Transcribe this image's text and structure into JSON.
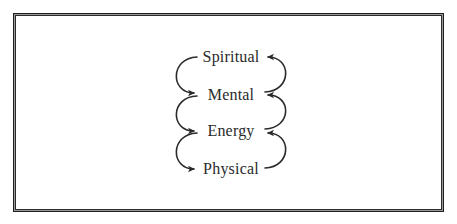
{
  "diagram": {
    "type": "cycle-stack",
    "levels": [
      {
        "label": "Spiritual"
      },
      {
        "label": "Mental"
      },
      {
        "label": "Energy"
      },
      {
        "label": "Physical"
      }
    ],
    "connections": [
      {
        "from": "Spiritual",
        "to": "Mental",
        "side": "left",
        "direction": "down"
      },
      {
        "from": "Mental",
        "to": "Energy",
        "side": "left",
        "direction": "down"
      },
      {
        "from": "Energy",
        "to": "Physical",
        "side": "left",
        "direction": "down"
      },
      {
        "from": "Mental",
        "to": "Spiritual",
        "side": "right",
        "direction": "up"
      },
      {
        "from": "Energy",
        "to": "Mental",
        "side": "right",
        "direction": "up"
      },
      {
        "from": "Physical",
        "to": "Energy",
        "side": "right",
        "direction": "up"
      }
    ],
    "colors": {
      "text": "#2a2a2a",
      "arrow": "#2a2a2a",
      "border": "#1e1e1e"
    }
  }
}
